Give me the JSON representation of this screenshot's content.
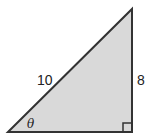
{
  "diagram": {
    "type": "right-triangle",
    "fill_color": "#d9d9d9",
    "stroke_color": "#333333",
    "labels": {
      "hypotenuse": "10",
      "vertical_side": "8",
      "angle": "θ"
    },
    "right_angle_marker": true
  }
}
